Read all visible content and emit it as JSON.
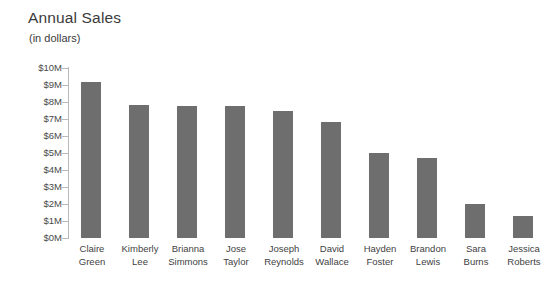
{
  "chart_data": {
    "type": "bar",
    "title": "Annual Sales",
    "subtitle": "(in dollars)",
    "xlabel": "",
    "ylabel": "",
    "ylim": [
      0,
      10
    ],
    "y_unit": "millions of dollars",
    "grid": false,
    "legend": "none",
    "orientation": "vertical",
    "bar_color": "#6e6e6e",
    "axis_color": "#b9b9b9",
    "y_ticks": [
      10,
      9,
      8,
      7,
      6,
      5,
      4,
      3,
      2,
      1,
      0
    ],
    "y_tick_labels": [
      "$10M",
      "$9M",
      "$8M",
      "$7M",
      "$6M",
      "$5M",
      "$4M",
      "$3M",
      "$2M",
      "$1M",
      "$0M"
    ],
    "categories": [
      "Claire Green",
      "Kimberly Lee",
      "Brianna Simmons",
      "Jose Taylor",
      "Joseph Reynolds",
      "David Wallace",
      "Hayden Foster",
      "Brandon Lewis",
      "Sara Burns",
      "Jessica Roberts"
    ],
    "category_lines": [
      [
        "Claire",
        "Green"
      ],
      [
        "Kimberly",
        "Lee"
      ],
      [
        "Brianna",
        "Simmons"
      ],
      [
        "Jose",
        "Taylor"
      ],
      [
        "Joseph",
        "Reynolds"
      ],
      [
        "David",
        "Wallace"
      ],
      [
        "Hayden",
        "Foster"
      ],
      [
        "Brandon",
        "Lewis"
      ],
      [
        "Sara",
        "Burns"
      ],
      [
        "Jessica",
        "Roberts"
      ]
    ],
    "values": [
      9.2,
      7.8,
      7.75,
      7.75,
      7.5,
      6.8,
      5.0,
      4.7,
      2.0,
      1.3
    ],
    "value_labels": [
      "$9.2M",
      "$7.8M",
      "$7.75M",
      "$7.75M",
      "$7.5M",
      "$6.8M",
      "$5.0M",
      "$4.7M",
      "$2.0M",
      "$1.3M"
    ]
  }
}
